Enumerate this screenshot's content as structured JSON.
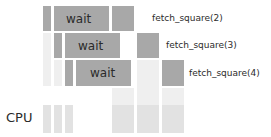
{
  "diagram": {
    "axis_label": "CPU",
    "colors": {
      "active": "#a8a8a8",
      "idle": "#e2e2e2",
      "idle_faint": "#efefef",
      "text": "#2b2b2b",
      "background": "#ffffff"
    },
    "rows": [
      {
        "id": "row-1",
        "call_label": "fetch_square(2)",
        "wait_label": "wait",
        "wait_text_x": 66,
        "wait_text_y": 13,
        "call_label_x": 152,
        "call_label_y": 14,
        "segments": [
          {
            "kind": "active",
            "x": 43,
            "y": 6,
            "w": 8,
            "h": 25
          },
          {
            "kind": "active",
            "x": 54,
            "y": 6,
            "w": 55,
            "h": 25
          },
          {
            "kind": "active",
            "x": 112,
            "y": 6,
            "w": 22,
            "h": 25
          }
        ]
      },
      {
        "id": "row-2",
        "call_label": "fetch_square(3)",
        "wait_label": "wait",
        "wait_text_x": 78,
        "wait_text_y": 40,
        "call_label_x": 166,
        "call_label_y": 41,
        "segments": [
          {
            "kind": "active",
            "x": 54,
            "y": 33,
            "w": 8,
            "h": 25
          },
          {
            "kind": "active",
            "x": 65,
            "y": 33,
            "w": 55,
            "h": 25
          },
          {
            "kind": "active",
            "x": 137,
            "y": 33,
            "w": 22,
            "h": 25
          }
        ]
      },
      {
        "id": "row-3",
        "call_label": "fetch_square(4)",
        "wait_label": "wait",
        "wait_text_x": 90,
        "wait_text_y": 67,
        "call_label_x": 189,
        "call_label_y": 69,
        "segments": [
          {
            "kind": "active",
            "x": 65,
            "y": 60,
            "w": 8,
            "h": 26
          },
          {
            "kind": "active",
            "x": 76,
            "y": 60,
            "w": 55,
            "h": 26
          },
          {
            "kind": "active",
            "x": 162,
            "y": 60,
            "w": 22,
            "h": 26
          }
        ]
      }
    ],
    "gap_segments": [
      {
        "id": "gap-a",
        "kind": "idle_faint",
        "x": 43,
        "y": 33,
        "w": 8,
        "h": 53
      },
      {
        "id": "gap-b",
        "kind": "idle_faint",
        "x": 54,
        "y": 60,
        "w": 8,
        "h": 26
      },
      {
        "id": "gap-c",
        "kind": "idle_faint",
        "x": 112,
        "y": 88,
        "w": 22,
        "h": 17
      },
      {
        "id": "gap-d",
        "kind": "idle_faint",
        "x": 137,
        "y": 60,
        "w": 22,
        "h": 45
      },
      {
        "id": "gap-e",
        "kind": "idle_faint",
        "x": 162,
        "y": 88,
        "w": 22,
        "h": 17
      }
    ],
    "cpu_row": {
      "id": "cpu-row",
      "y": 105,
      "h": 28,
      "segments": [
        {
          "kind": "idle",
          "x": 43,
          "w": 8
        },
        {
          "kind": "idle",
          "x": 54,
          "w": 8
        },
        {
          "kind": "idle",
          "x": 65,
          "w": 8
        },
        {
          "kind": "idle",
          "x": 112,
          "w": 22
        },
        {
          "kind": "idle",
          "x": 137,
          "w": 22
        },
        {
          "kind": "idle",
          "x": 162,
          "w": 22
        }
      ]
    }
  }
}
